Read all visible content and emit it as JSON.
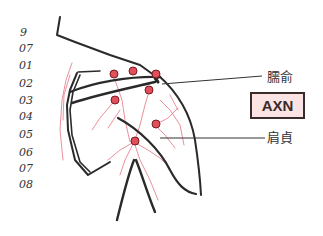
{
  "margin_numbers": [
    "9",
    "07",
    "01",
    "02",
    "03",
    "04",
    "05",
    "06",
    "07",
    "08"
  ],
  "labels": {
    "upper": "臑俞",
    "lower": "肩貞"
  },
  "badge": {
    "text": "AXN",
    "fill": "#fbe3e3",
    "border": "#3a2a2a"
  },
  "colors": {
    "acupoint": "#e0505a",
    "vessel": "#e05a6a",
    "outline": "#2a2a2a"
  },
  "acupoint_count": 8
}
